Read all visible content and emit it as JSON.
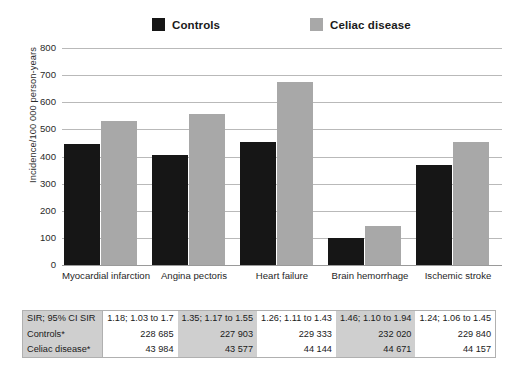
{
  "legend": {
    "items": [
      {
        "label": "Controls",
        "color": "#161616",
        "icon": "square-swatch-icon"
      },
      {
        "label": "Celiac disease",
        "color": "#a8a8a8",
        "icon": "square-swatch-icon"
      }
    ]
  },
  "chart_data": {
    "type": "bar",
    "title": "",
    "subtitle": "",
    "xlabel": "",
    "ylabel": "Incidence/100 000 person-years",
    "ylim": [
      0,
      800
    ],
    "yticks": [
      0,
      100,
      200,
      300,
      400,
      500,
      600,
      700,
      800
    ],
    "ytick_labels": [
      "0",
      "100",
      "200",
      "300",
      "400",
      "500",
      "600",
      "700",
      "800"
    ],
    "grid": true,
    "legend_position": "top-center",
    "categories": [
      "Myocardial infarction",
      "Angina pectoris",
      "Heart failure",
      "Brain hemorrhage",
      "Ischemic stroke"
    ],
    "series": [
      {
        "name": "Controls",
        "color": "#161616",
        "values": [
          445,
          405,
          455,
          100,
          370
        ]
      },
      {
        "name": "Celiac disease",
        "color": "#a8a8a8",
        "values": [
          530,
          555,
          675,
          145,
          455
        ]
      }
    ]
  },
  "table": {
    "rows": [
      {
        "label": "SIR; 95% CI SIR",
        "values": [
          "1.18; 1.03 to 1.7",
          "1.35; 1.17 to 1.55",
          "1.26; 1.11 to 1.43",
          "1.46; 1.10 to 1.94",
          "1.24; 1.06 to 1.45"
        ]
      },
      {
        "label": "Controls*",
        "values": [
          "228 685",
          "227 903",
          "229 333",
          "232 020",
          "229 840"
        ]
      },
      {
        "label": "Celiac disease*",
        "values": [
          "43 984",
          "43 577",
          "44 144",
          "44 671",
          "44 157"
        ]
      }
    ],
    "column_shading": [
      "plain",
      "shaded",
      "plain",
      "shaded",
      "plain"
    ]
  }
}
